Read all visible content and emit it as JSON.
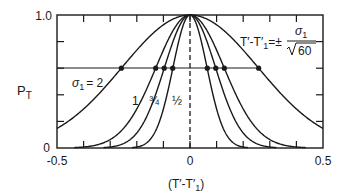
{
  "chart_data": {
    "type": "line",
    "title": "",
    "xlabel": "(T′-T′₁)",
    "ylabel": "P_T",
    "xlim": [
      -0.5,
      0.5
    ],
    "ylim": [
      0,
      1.0
    ],
    "x_tick_labels": [
      "-0.5",
      "0",
      "0.5"
    ],
    "y_tick_labels": [
      "0",
      "1.0"
    ],
    "x_minor_ticks_step": 0.1,
    "y_minor_ticks_step": 0.2,
    "grid": false,
    "center_dashed_line_x": 0,
    "threshold_line_y": 0.6,
    "annotation_formula": "T′-T′₁ = ± σ₁ / √60",
    "series": [
      {
        "name": "σ1 = 2",
        "label": "σ₁ = 2",
        "sigma": 2,
        "intersections_x": [
          -0.258,
          0.258
        ]
      },
      {
        "name": "σ1 = 1",
        "label": "1",
        "sigma": 1,
        "intersections_x": [
          -0.129,
          0.129
        ]
      },
      {
        "name": "σ1 = 3/4",
        "label": "¾",
        "sigma": 0.75,
        "intersections_x": [
          -0.097,
          0.097
        ]
      },
      {
        "name": "σ1 = 1/2",
        "label": "½",
        "sigma": 0.5,
        "intersections_x": [
          -0.065,
          0.065
        ]
      }
    ],
    "curve_form": "Gaussian-like bell, peak P_T=1.0 at x=0, P_T=0.6 at x=±σ1/√60"
  },
  "labels": {
    "y_axis": "P",
    "y_axis_sub": "T",
    "x_axis": "(T′-T′",
    "x_axis_sub": "1",
    "x_axis_end": ")",
    "y_top": "1.0",
    "y_bottom": "0",
    "x_left": "-0.5",
    "x_mid": "0",
    "x_right": "0.5",
    "sigma_label_main": "σ",
    "sigma_label_sub": "1",
    "sigma_label_val": "= 2",
    "label_1": "1",
    "label_34": "¾",
    "label_12": "½",
    "formula_lhs": "T′-T′",
    "formula_lhs_sub": "1",
    "formula_eq": "=±",
    "formula_num": "σ",
    "formula_num_sub": "1",
    "formula_den": "60"
  }
}
